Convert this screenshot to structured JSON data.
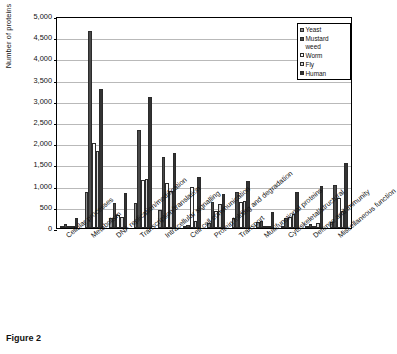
{
  "chart_data": {
    "type": "bar",
    "title": "",
    "xlabel": "",
    "ylabel": "Number of proteins",
    "ylim": [
      0,
      5000
    ],
    "ytick_step": 500,
    "grid": true,
    "legend_position": "top-right",
    "ytick_labels": [
      "5,000",
      "4,500",
      "4,000",
      "3,500",
      "3,000",
      "2,500",
      "2,000",
      "1,500",
      "1,000",
      "500",
      "0"
    ],
    "categories": [
      "Cellular processes",
      "Metabolism",
      "DNA replication/modification",
      "Transcription/translation",
      "Intracellular signalling",
      "Cell-cell communication",
      "Protein folding and degradation",
      "Transport",
      "Multifunctional proteins",
      "Cytoskeletal/structural",
      "Defence and immunity",
      "Miscellaneous function"
    ],
    "series": [
      {
        "name": "Yeast",
        "color": "#8d8d8d",
        "values": [
          55,
          850,
          240,
          580,
          430,
          30,
          120,
          240,
          135,
          20,
          20,
          145
        ]
      },
      {
        "name": "Mustard weed",
        "color": "#4a4a4a",
        "values": [
          95,
          4650,
          580,
          2310,
          1670,
          75,
          620,
          860,
          175,
          230,
          95,
          1010
        ]
      },
      {
        "name": "Worm",
        "color": "#fdfdfd",
        "values": [
          30,
          2000,
          310,
          1130,
          1070,
          960,
          400,
          610,
          25,
          260,
          20,
          700
        ]
      },
      {
        "name": "Fly",
        "color": "#d8d8d8",
        "values": [
          25,
          1820,
          250,
          1150,
          880,
          160,
          570,
          630,
          40,
          330,
          125,
          400
        ]
      },
      {
        "name": "Human",
        "color": "#333333",
        "values": [
          240,
          3280,
          830,
          3100,
          1780,
          1210,
          800,
          1100,
          370,
          860,
          980,
          1530
        ]
      }
    ]
  },
  "caption": {
    "label": "Figure 2",
    "text": ""
  }
}
